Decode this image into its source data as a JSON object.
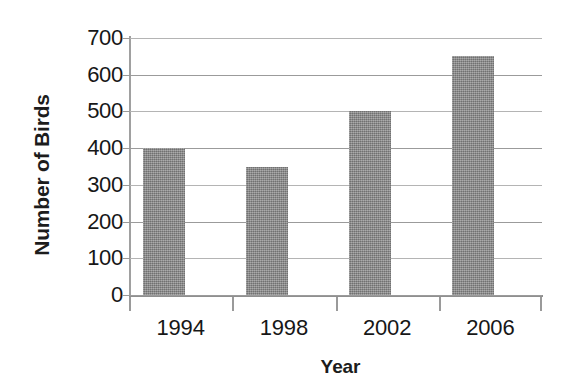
{
  "chart_data": {
    "type": "bar",
    "title": "",
    "subtitle": "",
    "xlabel": "Year",
    "ylabel": "Number of Birds",
    "categories": [
      "1994",
      "1998",
      "2002",
      "2006"
    ],
    "values": [
      400,
      350,
      500,
      650
    ],
    "series": [
      {
        "name": "Number of Birds",
        "values": [
          400,
          350,
          500,
          650
        ]
      }
    ],
    "ylim": [
      0,
      700
    ],
    "y_ticks": [
      0,
      100,
      200,
      300,
      400,
      500,
      600,
      700
    ],
    "y_tick_labels": [
      "0",
      "100",
      "200",
      "300",
      "400",
      "500",
      "600",
      "700"
    ],
    "grid": "horizontal",
    "legend": "none",
    "annotations": [],
    "colors": {
      "bar_fill": "#8a8a8a",
      "gridline": "#9b9b9b",
      "axis_line": "#9a9a9a",
      "text": "#171717",
      "background": "#ffffff"
    }
  }
}
